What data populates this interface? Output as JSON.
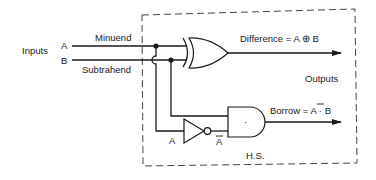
{
  "diagram": {
    "inputs_label": "Inputs",
    "input_a": "A",
    "input_b": "B",
    "minuend_label": "Minuend",
    "subtrahend_label": "Subtrahend",
    "difference_label": "Difference = A ⊕ B",
    "outputs_label": "Outputs",
    "borrow_prefix": "Borrow = ",
    "borrow_abar": "A",
    "borrow_suffix": " · B",
    "not_input_label": "A",
    "not_output_label": "A",
    "and_symbol": "·",
    "block_label": "H.S.",
    "gates": [
      "XOR",
      "NOT",
      "AND"
    ]
  }
}
